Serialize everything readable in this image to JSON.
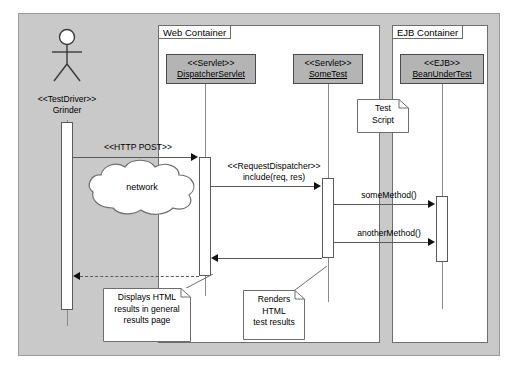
{
  "diagram": {
    "type": "uml-sequence-diagram",
    "containers": [
      {
        "label": "Web Container"
      },
      {
        "label": "EJB Container"
      }
    ],
    "actor": {
      "stereotype": "<<TestDriver>>",
      "name": "Grinder",
      "icon": "actor-stick-figure"
    },
    "participants": [
      {
        "stereotype": "<<Servlet>>",
        "name": "DispatcherServlet"
      },
      {
        "stereotype": "<<Servlet>>",
        "name": "SomeTest"
      },
      {
        "stereotype": "<<EJB>>",
        "name": "BeanUnderTest"
      }
    ],
    "messages": [
      {
        "label": "<<HTTP POST>>",
        "kind": "call"
      },
      {
        "label_line1": "<<RequestDispatcher>>",
        "label_line2": "include(req, res)",
        "kind": "call"
      },
      {
        "label": "someMethod()",
        "kind": "call"
      },
      {
        "label": "anotherMethod()",
        "kind": "call"
      },
      {
        "label": "",
        "kind": "return"
      },
      {
        "label": "",
        "kind": "return"
      }
    ],
    "cloud": {
      "label": "network",
      "icon": "cloud-shape"
    },
    "notes": [
      {
        "id": "test-script",
        "line1": "Test",
        "line2": "Script"
      },
      {
        "id": "displays-html",
        "line1": "Displays HTML",
        "line2": "results in general",
        "line3": "results page"
      },
      {
        "id": "renders-html",
        "line1": "Renders",
        "line2": "HTML",
        "line3": "test results"
      }
    ],
    "colors": {
      "frame_fill": "#c9c9c9",
      "container_fill": "#ffffff",
      "classifier_fill": "#b4b4b4",
      "line": "#5a5a5a"
    }
  }
}
